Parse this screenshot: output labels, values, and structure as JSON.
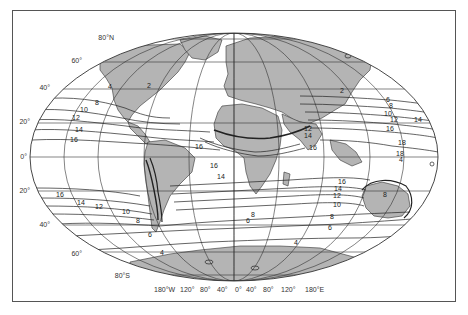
{
  "map": {
    "projection": "elliptical world map",
    "land_color": "#b4b4b4",
    "line_color": "#333333",
    "latitude_labels": [
      {
        "text": "80°N",
        "x": 114,
        "y": 40
      },
      {
        "text": "60°",
        "x": 82,
        "y": 63
      },
      {
        "text": "40°",
        "x": 50,
        "y": 89
      },
      {
        "text": "20°",
        "x": 28,
        "y": 123
      },
      {
        "text": "0°",
        "x": 23,
        "y": 157
      },
      {
        "text": "20°",
        "x": 28,
        "y": 191
      },
      {
        "text": "40°",
        "x": 48,
        "y": 226
      },
      {
        "text": "60°",
        "x": 81,
        "y": 255
      },
      {
        "text": "80°S",
        "x": 117,
        "y": 277
      }
    ],
    "longitude_labels": [
      {
        "text": "180°W",
        "x": 152,
        "y": 290
      },
      {
        "text": "120°",
        "x": 180,
        "y": 290
      },
      {
        "text": "80°",
        "x": 198,
        "y": 290
      },
      {
        "text": "40°",
        "x": 216,
        "y": 290
      },
      {
        "text": "0°",
        "x": 235,
        "y": 290
      },
      {
        "text": "40°",
        "x": 248,
        "y": 290
      },
      {
        "text": "80°",
        "x": 266,
        "y": 290
      },
      {
        "text": "120°",
        "x": 284,
        "y": 290
      },
      {
        "text": "180°E",
        "x": 306,
        "y": 290
      }
    ],
    "contour_labels": [
      {
        "text": "2",
        "x": 147,
        "y": 88
      },
      {
        "text": "4",
        "x": 108,
        "y": 89
      },
      {
        "text": "8",
        "x": 95,
        "y": 105
      },
      {
        "text": "10",
        "x": 83,
        "y": 112
      },
      {
        "text": "12",
        "x": 74,
        "y": 119
      },
      {
        "text": "14",
        "x": 75,
        "y": 131
      },
      {
        "text": "16",
        "x": 70,
        "y": 141
      },
      {
        "text": "16",
        "x": 195,
        "y": 148
      },
      {
        "text": "16",
        "x": 210,
        "y": 167
      },
      {
        "text": "14",
        "x": 217,
        "y": 178
      },
      {
        "text": "16",
        "x": 309,
        "y": 149
      },
      {
        "text": "14",
        "x": 304,
        "y": 137
      },
      {
        "text": "12",
        "x": 304,
        "y": 131
      },
      {
        "text": "2",
        "x": 340,
        "y": 92
      },
      {
        "text": "6",
        "x": 386,
        "y": 101
      },
      {
        "text": "8",
        "x": 389,
        "y": 107
      },
      {
        "text": "10",
        "x": 384,
        "y": 115
      },
      {
        "text": "12",
        "x": 390,
        "y": 121
      },
      {
        "text": "14",
        "x": 414,
        "y": 121
      },
      {
        "text": "16",
        "x": 386,
        "y": 130
      },
      {
        "text": "18",
        "x": 398,
        "y": 144
      },
      {
        "text": "18",
        "x": 396,
        "y": 155
      },
      {
        "text": "16",
        "x": 56,
        "y": 196
      },
      {
        "text": "14",
        "x": 77,
        "y": 204
      },
      {
        "text": "12",
        "x": 95,
        "y": 208
      },
      {
        "text": "10",
        "x": 122,
        "y": 213
      },
      {
        "text": "8",
        "x": 136,
        "y": 222
      },
      {
        "text": "6",
        "x": 148,
        "y": 236
      },
      {
        "text": "4",
        "x": 160,
        "y": 254
      },
      {
        "text": "16",
        "x": 338,
        "y": 183
      },
      {
        "text": "14",
        "x": 334,
        "y": 190
      },
      {
        "text": "12",
        "x": 333,
        "y": 197
      },
      {
        "text": "10",
        "x": 333,
        "y": 206
      },
      {
        "text": "8",
        "x": 332,
        "y": 219
      },
      {
        "text": "8",
        "x": 251,
        "y": 216
      },
      {
        "text": "6",
        "x": 246,
        "y": 222
      },
      {
        "text": "6",
        "x": 328,
        "y": 229
      },
      {
        "text": "4",
        "x": 294,
        "y": 244
      },
      {
        "text": "8",
        "x": 383,
        "y": 196
      },
      {
        "text": "4",
        "x": 399,
        "y": 161
      },
      {
        "text": "4",
        "x": 160,
        "y": 256
      }
    ]
  }
}
